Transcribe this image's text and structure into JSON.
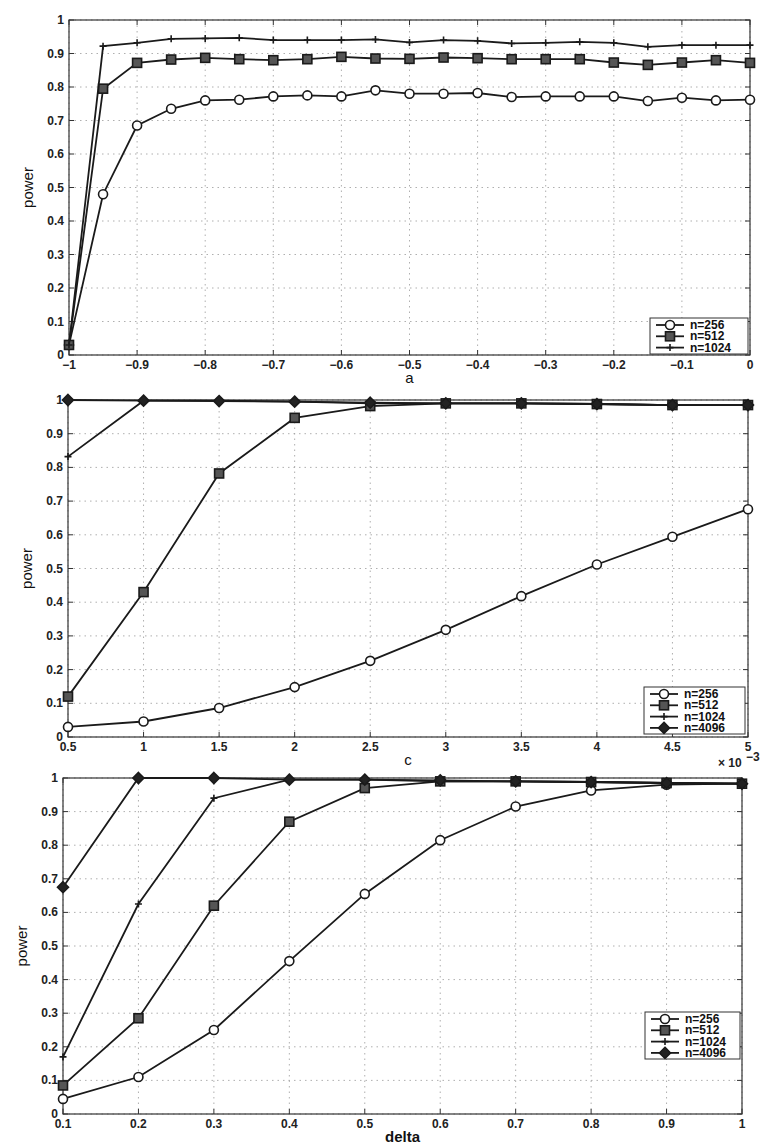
{
  "chart_data": [
    {
      "type": "line",
      "title": "",
      "xlabel": "a",
      "ylabel": "power",
      "xlim": [
        -1,
        0
      ],
      "ylim": [
        0,
        1
      ],
      "grid": true,
      "legend_position": "lower right",
      "xticks": [
        "-1",
        "-0.9",
        "-0.8",
        "-0.7",
        "-0.6",
        "-0.5",
        "-0.4",
        "-0.3",
        "-0.2",
        "-0.1",
        "0"
      ],
      "yticks": [
        "0",
        "0.1",
        "0.2",
        "0.3",
        "0.4",
        "0.5",
        "0.6",
        "0.7",
        "0.8",
        "0.9",
        "1"
      ],
      "x": [
        -1,
        -0.95,
        -0.9,
        -0.85,
        -0.8,
        -0.75,
        -0.7,
        -0.65,
        -0.6,
        -0.55,
        -0.5,
        -0.45,
        -0.4,
        -0.35,
        -0.3,
        -0.25,
        -0.2,
        -0.15,
        -0.1,
        -0.05,
        0
      ],
      "series": [
        {
          "name": "n=256",
          "marker": "circle",
          "values": [
            0.03,
            0.48,
            0.685,
            0.735,
            0.76,
            0.762,
            0.772,
            0.775,
            0.772,
            0.79,
            0.78,
            0.78,
            0.782,
            0.77,
            0.772,
            0.772,
            0.772,
            0.758,
            0.768,
            0.76,
            0.762
          ]
        },
        {
          "name": "n=512",
          "marker": "square",
          "values": [
            0.03,
            0.795,
            0.872,
            0.882,
            0.887,
            0.883,
            0.88,
            0.883,
            0.89,
            0.885,
            0.884,
            0.888,
            0.886,
            0.883,
            0.883,
            0.883,
            0.873,
            0.866,
            0.873,
            0.88,
            0.872
          ]
        },
        {
          "name": "n=1024",
          "marker": "plus",
          "values": [
            0.03,
            0.922,
            0.932,
            0.944,
            0.945,
            0.947,
            0.94,
            0.94,
            0.94,
            0.942,
            0.933,
            0.94,
            0.938,
            0.93,
            0.932,
            0.935,
            0.932,
            0.92,
            0.925,
            0.925,
            0.925
          ]
        }
      ]
    },
    {
      "type": "line",
      "title": "",
      "xlabel": "c",
      "ylabel": "power",
      "x_multiplier_label": "x 10^-3",
      "xlim": [
        0.5,
        5
      ],
      "ylim": [
        0,
        1
      ],
      "grid": true,
      "legend_position": "lower right",
      "xticks": [
        "0.5",
        "1",
        "1.5",
        "2",
        "2.5",
        "3",
        "3.5",
        "4",
        "4.5",
        "5"
      ],
      "yticks": [
        "0",
        "0.1",
        "0.2",
        "0.3",
        "0.4",
        "0.5",
        "0.6",
        "0.7",
        "0.8",
        "0.9",
        "1"
      ],
      "x": [
        0.5,
        1,
        1.5,
        2,
        2.5,
        3,
        3.5,
        4,
        4.5,
        5
      ],
      "series": [
        {
          "name": "n=256",
          "marker": "circle",
          "values": [
            0.03,
            0.046,
            0.086,
            0.148,
            0.226,
            0.318,
            0.418,
            0.512,
            0.594,
            0.676
          ]
        },
        {
          "name": "n=512",
          "marker": "square",
          "values": [
            0.12,
            0.43,
            0.782,
            0.947,
            0.982,
            0.99,
            0.99,
            0.988,
            0.985,
            0.985
          ]
        },
        {
          "name": "n=1024",
          "marker": "plus",
          "values": [
            0.832,
            0.998,
            0.998,
            0.995,
            0.99,
            0.99,
            0.99,
            0.988,
            0.985,
            0.985
          ]
        },
        {
          "name": "n=4096",
          "marker": "diamond",
          "values": [
            1.0,
            0.998,
            0.997,
            0.995,
            0.992,
            0.99,
            0.99,
            0.988,
            0.985,
            0.985
          ]
        }
      ]
    },
    {
      "type": "line",
      "title": "",
      "xlabel": "delta",
      "ylabel": "power",
      "xlim": [
        0.1,
        1
      ],
      "ylim": [
        0,
        1
      ],
      "grid": true,
      "legend_position": "center right",
      "xticks": [
        "0.1",
        "0.2",
        "0.3",
        "0.4",
        "0.5",
        "0.6",
        "0.7",
        "0.8",
        "0.9",
        "1"
      ],
      "yticks": [
        "0",
        "0.1",
        "0.2",
        "0.3",
        "0.4",
        "0.5",
        "0.6",
        "0.7",
        "0.8",
        "0.9",
        "1"
      ],
      "x": [
        0.1,
        0.2,
        0.3,
        0.4,
        0.5,
        0.6,
        0.7,
        0.8,
        0.9,
        1.0
      ],
      "series": [
        {
          "name": "n=256",
          "marker": "circle",
          "values": [
            0.045,
            0.11,
            0.25,
            0.455,
            0.655,
            0.815,
            0.915,
            0.963,
            0.98,
            0.983
          ]
        },
        {
          "name": "n=512",
          "marker": "square",
          "values": [
            0.085,
            0.285,
            0.62,
            0.87,
            0.97,
            0.99,
            0.99,
            0.988,
            0.985,
            0.983
          ]
        },
        {
          "name": "n=1024",
          "marker": "plus",
          "values": [
            0.17,
            0.625,
            0.94,
            0.995,
            0.995,
            0.99,
            0.99,
            0.988,
            0.985,
            0.983
          ]
        },
        {
          "name": "n=4096",
          "marker": "diamond",
          "values": [
            0.675,
            1.0,
            1.0,
            0.995,
            0.995,
            0.993,
            0.99,
            0.988,
            0.985,
            0.983
          ]
        }
      ]
    }
  ],
  "layout": [
    {
      "left": 69,
      "right": 750,
      "top": 20,
      "bottom": 355,
      "legend": {
        "x": 650,
        "y": 318,
        "w": 98,
        "h": 36
      }
    },
    {
      "left": 68,
      "right": 748,
      "top": 400,
      "bottom": 737,
      "legend": {
        "x": 644,
        "y": 687,
        "w": 101,
        "h": 47
      }
    },
    {
      "left": 63,
      "right": 742,
      "top": 778,
      "bottom": 1114,
      "legend": {
        "x": 645,
        "y": 1012,
        "w": 95,
        "h": 47
      }
    }
  ],
  "colors": {
    "line": "#1a1a1a",
    "grid": "#9a9a9a",
    "axis": "#333333",
    "background": "#ffffff"
  }
}
